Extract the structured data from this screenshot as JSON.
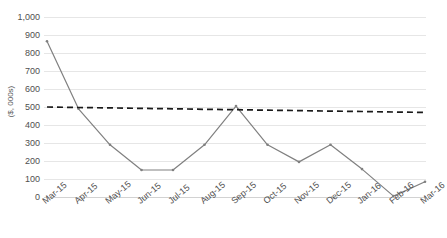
{
  "chart_data": {
    "type": "line",
    "title": "",
    "xlabel": "",
    "ylabel": "($, 000s)",
    "ylim": [
      0,
      1000
    ],
    "ytick_step": 100,
    "grid": true,
    "legend": "none",
    "categories": [
      "Mar-15",
      "Apr-15",
      "May-15",
      "Jun-15",
      "Jul-15",
      "Aug-15",
      "Sep-15",
      "Oct-15",
      "Nov-15",
      "Dec-15",
      "Jan-16",
      "Feb-16",
      "Mar-16"
    ],
    "ytick_labels": [
      "1,000",
      "900",
      "800",
      "700",
      "600",
      "500",
      "400",
      "300",
      "200",
      "100",
      "0"
    ],
    "ytick_values": [
      1000,
      900,
      800,
      700,
      600,
      500,
      400,
      300,
      200,
      100,
      0
    ],
    "series": [
      {
        "name": "Value",
        "kind": "line",
        "color": "#808080",
        "values": [
          865,
          490,
          290,
          150,
          150,
          290,
          505,
          290,
          195,
          290,
          155,
          5,
          85
        ]
      },
      {
        "name": "Trend",
        "kind": "dashed-trend",
        "color": "#1a1a1a",
        "values": [
          500,
          497,
          495,
          492,
          490,
          487,
          485,
          482,
          480,
          477,
          475,
          472,
          470
        ]
      }
    ]
  },
  "colors": {
    "series_line": "#808080",
    "trend_line": "#1a1a1a",
    "gridline": "#e6e6e6",
    "axis_text": "#4f4f4f",
    "background": "#ffffff"
  }
}
